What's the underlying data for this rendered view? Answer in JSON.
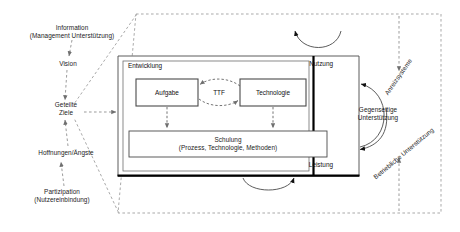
{
  "diagram": {
    "title_hidden": "",
    "outer_boundary": {
      "style": "dashed-parallelogram"
    },
    "left_chain": [
      {
        "id": "information",
        "line1": "Information",
        "line2": "(Management Unterstützung)"
      },
      {
        "id": "vision",
        "line1": "Vision",
        "line2": ""
      },
      {
        "id": "geteilte-ziele",
        "line1": "Geteilte",
        "line2": "Ziele"
      },
      {
        "id": "hoffnungen",
        "line1": "Hoffnungen/Ängste",
        "line2": ""
      },
      {
        "id": "partizipation",
        "line1": "Partizipation",
        "line2": "(Nutzereinbindung)"
      }
    ],
    "entwicklung": {
      "label": "Entwicklung",
      "aufgabe": "Aufgabe",
      "ttf": "TTF",
      "technologie": "Technologie",
      "schulung_line1": "Schulung",
      "schulung_line2": "(Prozess, Technologie, Methoden)"
    },
    "right_region": {
      "nutzung": "Nutzung",
      "leistung": "Leistung",
      "gegenseitige_line1": "Gegenseitige",
      "gegenseitige_line2": "Unterstützung"
    },
    "rotated_labels": [
      {
        "id": "anreizsysteme",
        "text": "Anreizsysteme"
      },
      {
        "id": "betriebliche",
        "text": "Betriebliche Unterstützung"
      }
    ],
    "colors": {
      "stroke": "#3a3a3a",
      "thick": "#000000",
      "dashed": "#8c8c8c",
      "text": "#1b1b1b",
      "background": "#ffffff"
    }
  }
}
